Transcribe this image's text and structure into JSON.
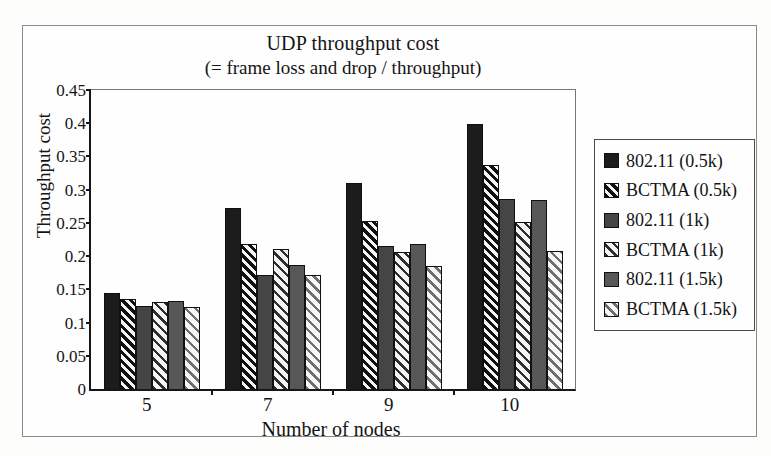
{
  "chart_data": {
    "type": "bar",
    "title": "UDP throughput cost",
    "subtitle": "(= frame loss and drop / throughput)",
    "xlabel": "Number of nodes",
    "ylabel": "Throughput cost",
    "categories": [
      "5",
      "7",
      "9",
      "10"
    ],
    "y_ticks": [
      "0",
      "0.05",
      "0.1",
      "0.15",
      "0.2",
      "0.25",
      "0.3",
      "0.35",
      "0.4",
      "0.45"
    ],
    "ylim": [
      0,
      0.45
    ],
    "grid": false,
    "legend_position": "right",
    "series": [
      {
        "name": "802.11 (0.5k)",
        "style": "solid-black",
        "values": [
          0.145,
          0.272,
          0.31,
          0.399
        ]
      },
      {
        "name": "BCTMA (0.5k)",
        "style": "hatch-dark",
        "values": [
          0.136,
          0.218,
          0.253,
          0.337
        ]
      },
      {
        "name": "802.11 (1k)",
        "style": "solid-darkgray",
        "values": [
          0.125,
          0.172,
          0.215,
          0.286
        ]
      },
      {
        "name": "BCTMA (1k)",
        "style": "hatch-medium",
        "values": [
          0.131,
          0.21,
          0.206,
          0.252
        ]
      },
      {
        "name": "802.11 (1.5k)",
        "style": "solid-gray",
        "values": [
          0.132,
          0.187,
          0.219,
          0.284
        ]
      },
      {
        "name": "BCTMA (1.5k)",
        "style": "hatch-light",
        "values": [
          0.124,
          0.172,
          0.185,
          0.207
        ]
      }
    ],
    "colors": {
      "bar_solid_black": "#1c1c1c",
      "bar_solid_darkgray": "#454545",
      "bar_solid_gray": "#575757",
      "hatch_stripe_dark": "#101010",
      "hatch_stripe_medium": "#2e2e2e",
      "hatch_stripe_light": "#6f6f6f",
      "hatch_background": "#f4f4f2",
      "axis": "#161616",
      "frame_border": "#8a8a8a",
      "background": "#fefefe"
    }
  }
}
